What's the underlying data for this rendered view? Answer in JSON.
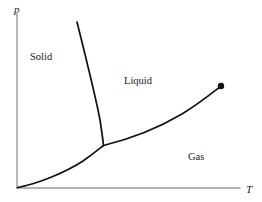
{
  "figure": {
    "kind": "phase-diagram",
    "background_color": "#ffffff",
    "width": 262,
    "height": 202
  },
  "axes": {
    "y_label": "p",
    "x_label": "T",
    "axis_color": "#9a9a9a",
    "origin": {
      "x": 17,
      "y": 188
    },
    "y_top": 14,
    "x_right": 240
  },
  "regions": [
    {
      "key": "solid",
      "label": "Solid",
      "x": 30,
      "y": 52
    },
    {
      "key": "liquid",
      "label": "Liquid",
      "x": 124,
      "y": 76
    },
    {
      "key": "gas",
      "label": "Gas",
      "x": 188,
      "y": 152
    }
  ],
  "points": {
    "triple_point": {
      "x": 103,
      "y": 145
    },
    "critical_point": {
      "x": 221,
      "y": 86,
      "radius": 3.2
    }
  },
  "curve_color": "#111111",
  "chart_data": {
    "type": "line",
    "title": "",
    "xlabel": "T",
    "ylabel": "p",
    "grid": false,
    "legend": false,
    "annotations": [
      "Solid",
      "Liquid",
      "Gas"
    ],
    "series": [
      {
        "name": "fusion-curve",
        "description": "solid-liquid coexistence, steep and nearly vertical",
        "path": "M 77 22 C 86 58, 96 98, 100 120 C 102 133, 103 140, 103.5 145.5"
      },
      {
        "name": "sublimation-curve",
        "description": "solid-gas coexistence, concave up from origin to triple point",
        "path": "M 17.5 187.5 C 38 184, 66 172, 83 161 C 93 154, 99 149, 103.5 145.5"
      },
      {
        "name": "vaporization-curve",
        "description": "liquid-gas coexistence, triple point to critical point",
        "path": "M 103.5 145.5 C 130 139, 160 127, 182 114 C 200 103, 212 93, 220.5 86.5"
      }
    ]
  }
}
